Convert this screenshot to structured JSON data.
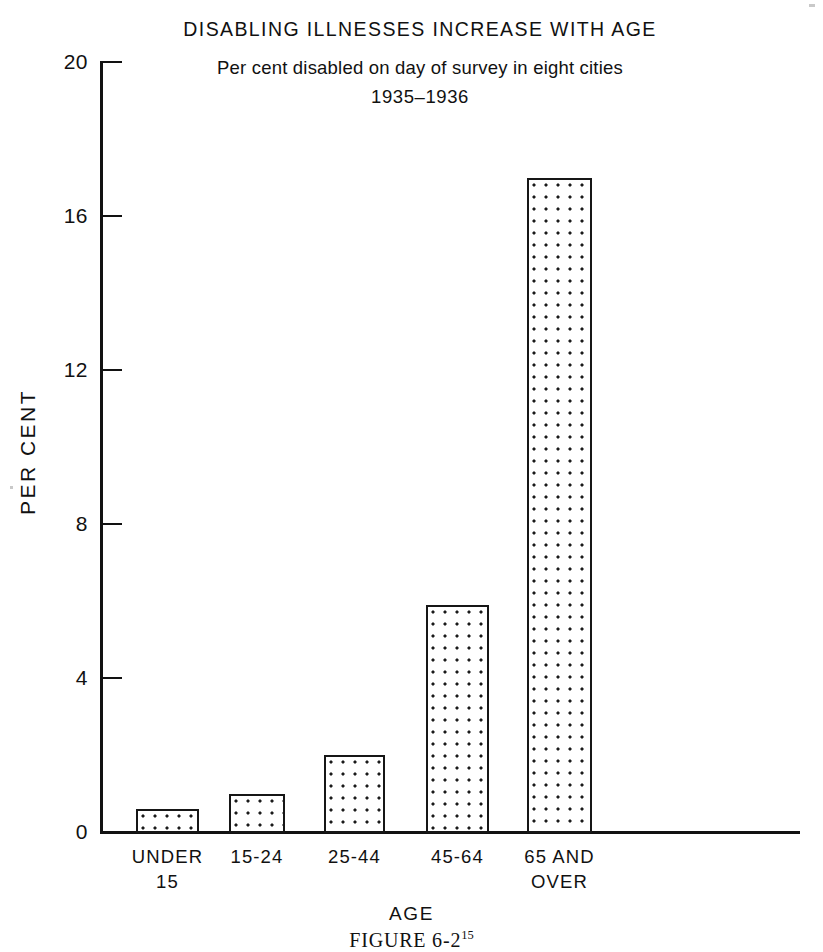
{
  "chart_data": {
    "type": "bar",
    "title": "DISABLING ILLNESSES INCREASE WITH AGE",
    "subtitle_line1": "Per cent disabled on day of survey in eight cities",
    "subtitle_line2": "1935–1936",
    "xlabel": "AGE",
    "ylabel": "PER  CENT",
    "ylim": [
      0,
      20
    ],
    "ytick_values": [
      0,
      4,
      8,
      12,
      16,
      20
    ],
    "ytick_labels": [
      "0",
      "4",
      "8",
      "12",
      "16",
      "20"
    ],
    "grid": false,
    "legend": "none",
    "categories": [
      "UNDER\n15",
      "15-24",
      "25-44",
      "45-64",
      "65  AND\nOVER"
    ],
    "categories_flat": [
      "UNDER 15",
      "15-24",
      "25-44",
      "45-64",
      "65 AND OVER"
    ],
    "values": [
      0.6,
      1.0,
      2.0,
      5.9,
      17.0
    ],
    "bar_fill": "dotted-pattern",
    "bar_edge_color": "#161616",
    "axis_color": "#121212",
    "background_color": "#ffffff"
  },
  "caption": {
    "text": "FIGURE 6-2",
    "superscript": "15"
  }
}
